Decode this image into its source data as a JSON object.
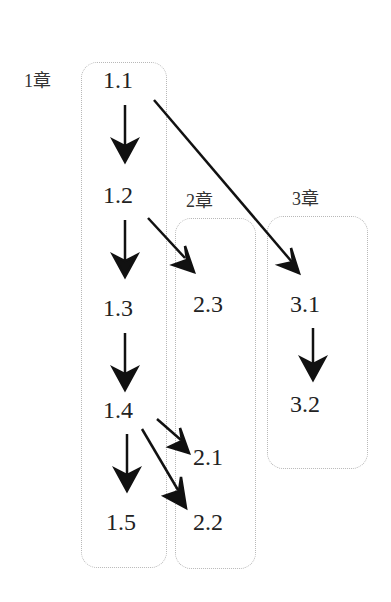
{
  "chapters": [
    {
      "label": "1章",
      "sections": [
        "1.1",
        "1.2",
        "1.3",
        "1.4",
        "1.5"
      ]
    },
    {
      "label": "2章",
      "sections": [
        "2.3",
        "2.1",
        "2.2"
      ]
    },
    {
      "label": "3章",
      "sections": [
        "3.1",
        "3.2"
      ]
    }
  ],
  "edges": [
    [
      "1.1",
      "1.2"
    ],
    [
      "1.2",
      "1.3"
    ],
    [
      "1.3",
      "1.4"
    ],
    [
      "1.4",
      "1.5"
    ],
    [
      "1.1",
      "3.1"
    ],
    [
      "1.2",
      "2.3"
    ],
    [
      "1.4",
      "2.1"
    ],
    [
      "1.4",
      "2.2"
    ],
    [
      "3.1",
      "3.2"
    ]
  ]
}
